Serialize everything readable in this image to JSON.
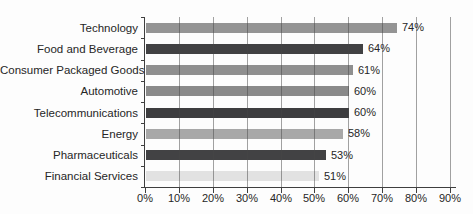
{
  "chart_data": {
    "type": "bar",
    "orientation": "horizontal",
    "title": "",
    "xlabel": "",
    "ylabel": "",
    "categories": [
      "Technology",
      "Food and Beverage",
      "Consumer Packaged Goods",
      "Automotive",
      "Telecommunications",
      "Energy",
      "Pharmaceuticals",
      "Financial Services"
    ],
    "values": [
      74,
      64,
      61,
      60,
      60,
      58,
      53,
      51
    ],
    "value_labels": [
      "74%",
      "64%",
      "61%",
      "60%",
      "60%",
      "58%",
      "53%",
      "51%"
    ],
    "bar_colors": [
      "#949494",
      "#414143",
      "#8f8f8f",
      "#8a8a8a",
      "#3d3d3f",
      "#a8a8a8",
      "#424244",
      "#e2e2e2"
    ],
    "x_ticks": [
      "0%",
      "10%",
      "20%",
      "30%",
      "40%",
      "50%",
      "60%",
      "70%",
      "80%",
      "90%"
    ],
    "x_tick_values": [
      0,
      10,
      20,
      30,
      40,
      50,
      60,
      70,
      80,
      90
    ],
    "xlim": [
      0,
      90
    ],
    "grid": true,
    "legend": "none"
  },
  "colors": {
    "background": "#fdfdfd",
    "axis": "#3f3f3f",
    "gridline": "rgba(70,70,70,0.5)",
    "text": "#262626"
  }
}
